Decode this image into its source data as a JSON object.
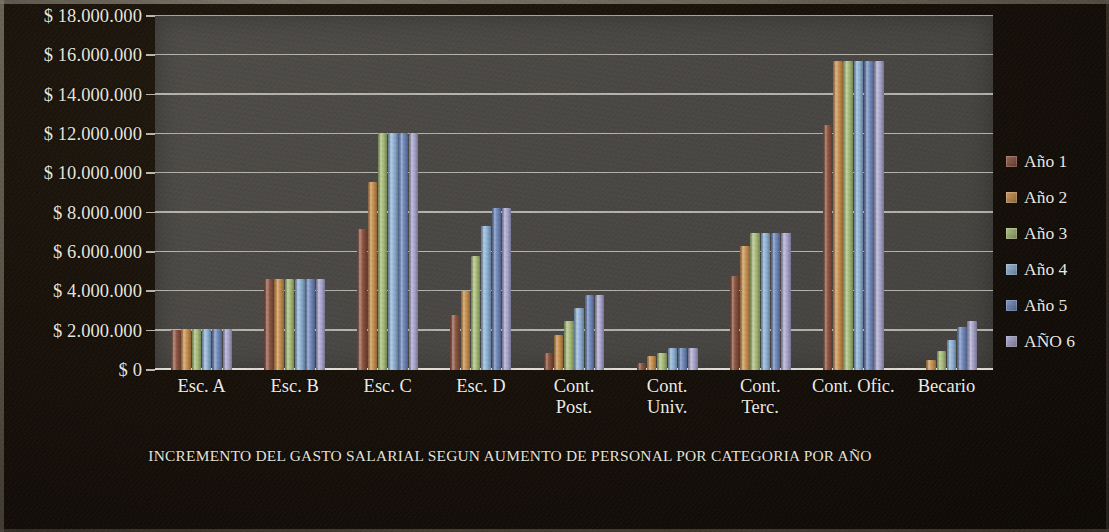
{
  "chart_data": {
    "type": "bar",
    "title": "INCREMENTO DEL GASTO SALARIAL SEGUN AUMENTO DE PERSONAL POR CATEGORIA POR AÑO",
    "xlabel": "",
    "ylabel": "",
    "ylim": [
      0,
      18000000
    ],
    "ytick_step": 2000000,
    "ytick_labels": [
      "$ 18.000.000",
      "$ 16.000.000",
      "$ 14.000.000",
      "$ 12.000.000",
      "$ 10.000.000",
      "$ 8.000.000",
      "$ 6.000.000",
      "$ 4.000.000",
      "$ 2.000.000",
      "$ 0"
    ],
    "ytick_values": [
      18000000,
      16000000,
      14000000,
      12000000,
      10000000,
      8000000,
      6000000,
      4000000,
      2000000,
      0
    ],
    "grid": true,
    "legend_position": "right",
    "categories": [
      "Esc. A",
      "Esc. B",
      "Esc. C",
      "Esc. D",
      "Cont.\nPost.",
      "Cont.\nUniv.",
      "Cont.\nTerc.",
      "Cont. Ofic.",
      "Becario"
    ],
    "series": [
      {
        "name": "Año 1",
        "color": "#8c5340",
        "values": [
          2050000,
          4650000,
          7150000,
          2800000,
          850000,
          350000,
          4800000,
          12450000,
          0
        ]
      },
      {
        "name": "Año 2",
        "color": "#c9904f",
        "values": [
          2080000,
          4650000,
          9550000,
          4000000,
          1800000,
          700000,
          6300000,
          15700000,
          500000
        ]
      },
      {
        "name": "Año 3",
        "color": "#a8bd78",
        "values": [
          2080000,
          4650000,
          12050000,
          5800000,
          2480000,
          880000,
          6950000,
          15700000,
          950000
        ]
      },
      {
        "name": "Año 4",
        "color": "#8fb3d6",
        "values": [
          2080000,
          4650000,
          12050000,
          7300000,
          3150000,
          1100000,
          6950000,
          15700000,
          1550000
        ]
      },
      {
        "name": "Año 5",
        "color": "#7089bd",
        "values": [
          2080000,
          4650000,
          12050000,
          8250000,
          3820000,
          1100000,
          6950000,
          15700000,
          2200000
        ]
      },
      {
        "name": "AÑO 6",
        "color": "#a9a6cf",
        "values": [
          2080000,
          4650000,
          12050000,
          8250000,
          3820000,
          1100000,
          6950000,
          15700000,
          2480000
        ]
      }
    ]
  }
}
